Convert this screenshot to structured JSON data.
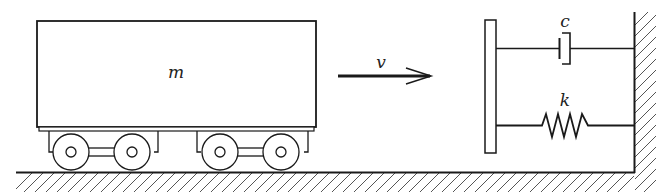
{
  "diagram": {
    "labels": {
      "mass": "m",
      "velocity": "v",
      "damper": "c",
      "spring": "k"
    },
    "components": [
      {
        "id": "railcar",
        "type": "mass-block",
        "label": "m"
      },
      {
        "id": "velocity-arrow",
        "type": "arrow",
        "direction": "right",
        "label": "v"
      },
      {
        "id": "buffer-plate",
        "type": "plate"
      },
      {
        "id": "damper",
        "type": "dashpot",
        "label": "c"
      },
      {
        "id": "spring",
        "type": "spring",
        "label": "k"
      },
      {
        "id": "wall",
        "type": "fixed-support"
      },
      {
        "id": "ground",
        "type": "fixed-support"
      }
    ],
    "colors": {
      "stroke": "#1a1a1a",
      "background": "#ffffff"
    }
  }
}
